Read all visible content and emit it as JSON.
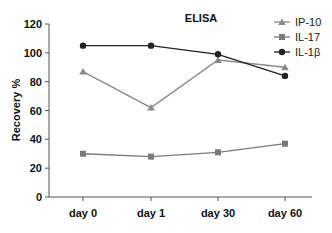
{
  "chart_data": {
    "type": "line",
    "title": "ELISA",
    "xlabel": "",
    "ylabel": "Recovery %",
    "categories": [
      "day 0",
      "day 1",
      "day 30",
      "day 60"
    ],
    "ylim": [
      0,
      120
    ],
    "yticks": [
      0,
      20,
      40,
      60,
      80,
      100,
      120
    ],
    "grid": false,
    "legend_position": "top-right",
    "series": [
      {
        "name": "IP-10",
        "marker": "triangle",
        "color": "#8a8a8a",
        "values": [
          87,
          62,
          95,
          90
        ]
      },
      {
        "name": "IL-17",
        "marker": "square",
        "color": "#7a7a7a",
        "values": [
          30,
          28,
          31,
          37
        ]
      },
      {
        "name": "IL-1β",
        "marker": "circle",
        "color": "#222222",
        "values": [
          105,
          105,
          99,
          84
        ]
      }
    ]
  }
}
